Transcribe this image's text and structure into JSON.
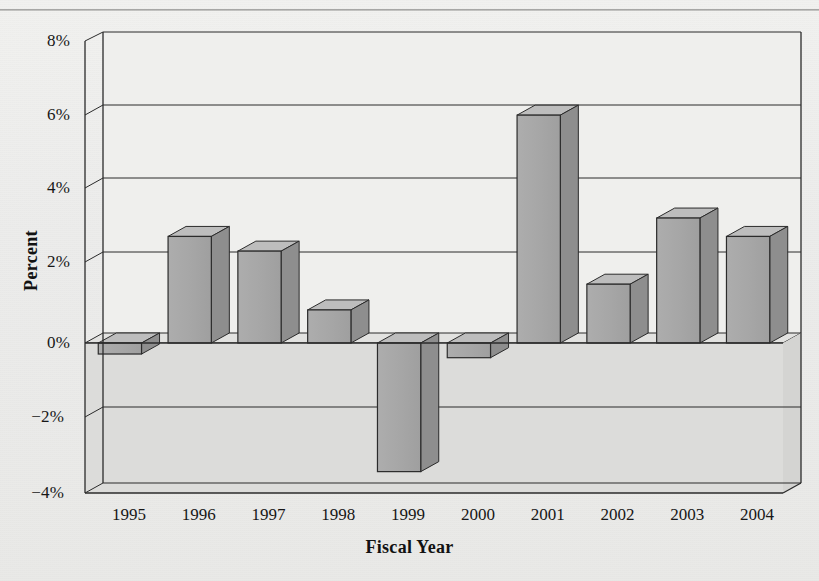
{
  "title": "",
  "chart_data": {
    "type": "bar",
    "title": "",
    "xlabel": "Fiscal Year",
    "ylabel": "Percent",
    "categories": [
      "1995",
      "1996",
      "1997",
      "1998",
      "1999",
      "2000",
      "2001",
      "2002",
      "2003",
      "2004"
    ],
    "values": [
      -0.3,
      2.9,
      2.5,
      0.9,
      -3.5,
      -0.4,
      6.2,
      1.6,
      3.4,
      2.9
    ],
    "ylim": [
      -4,
      8
    ],
    "yticks": [
      8,
      6,
      4,
      2,
      0,
      -2,
      -4
    ],
    "ytick_labels": [
      "8%",
      "6%",
      "4%",
      "2%",
      "0%",
      "−2%",
      "−4%"
    ],
    "grid": true,
    "legend": "none",
    "style": "3d-bars",
    "bar_face_color": "#a8a8a8",
    "bar_top_color": "#bdbdbd",
    "bar_side_color": "#8e8e8e",
    "wall_color": "#efefed",
    "floor_color": "#dcdcda",
    "line_color": "#2b2b2b"
  },
  "axes": {
    "y_label": "Percent",
    "x_label": "Fiscal Year"
  }
}
